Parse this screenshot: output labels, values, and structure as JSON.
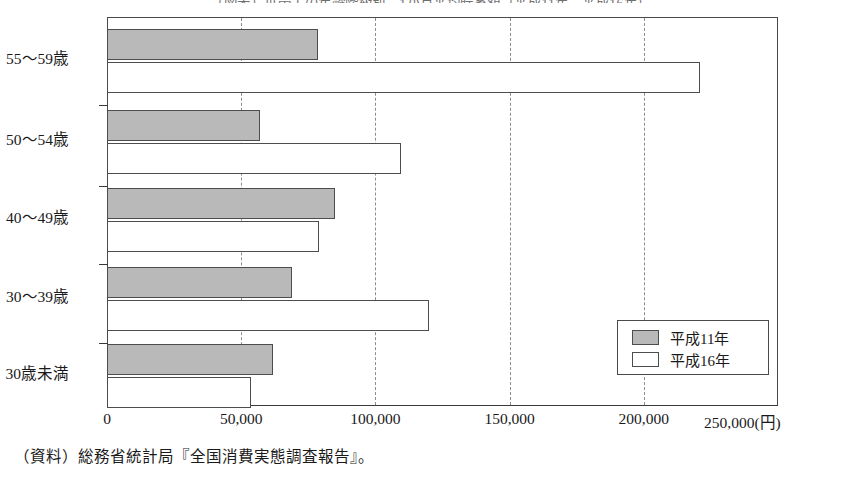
{
  "chart_data": {
    "type": "bar",
    "orientation": "horizontal",
    "title": "（図表）世帯主の年齢階級別　1か月平均貯蓄額（平成11年、平成16年）",
    "xlabel": "(円)",
    "ylabel": "",
    "categories": [
      "55～59歳",
      "50～54歳",
      "40～49歳",
      "30～39歳",
      "30歳未満"
    ],
    "series": [
      {
        "name": "平成11年",
        "color": "#b9b9b9",
        "values": [
          78700,
          57000,
          85000,
          69000,
          62000
        ]
      },
      {
        "name": "平成16年",
        "color": "#ffffff",
        "values": [
          221000,
          109700,
          79100,
          120100,
          53700
        ]
      }
    ],
    "xlim": [
      0,
      250000
    ],
    "xticks": [
      0,
      50000,
      100000,
      150000,
      200000,
      250000
    ],
    "xtick_labels": [
      "0",
      "50,000",
      "100,000",
      "150,000",
      "200,000",
      "250,000(円)"
    ],
    "grid": true,
    "grid_style": "dashed-vertical",
    "legend_position": "bottom-right",
    "source_note": "（資料）総務省統計局『全国消費実態調査報告』。"
  },
  "legend": {
    "items": [
      {
        "label": "平成11年"
      },
      {
        "label": "平成16年"
      }
    ]
  },
  "axis": {
    "x_tick_labels": [
      "0",
      "50,000",
      "100,000",
      "150,000",
      "200,000",
      "250,000(円)"
    ],
    "y_tick_labels": [
      "55～59歳",
      "50～54歳",
      "40～49歳",
      "30～39歳",
      "30歳未満"
    ]
  },
  "footer": {
    "source": "（資料）総務省統計局『全国消費実態調査報告』。"
  }
}
